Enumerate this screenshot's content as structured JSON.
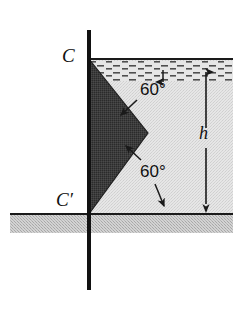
{
  "figure": {
    "type": "engineering-diagram",
    "canvas": {
      "width": 250,
      "height": 310,
      "background": "#ffffff"
    }
  },
  "labels": {
    "point_c": "C",
    "point_c_prime": "C′",
    "depth": "h",
    "angle_upper": "60°",
    "angle_lower": "60°"
  },
  "colors": {
    "wedge_fill": "#3a3a3a",
    "fluid_fill": "#e2e2e2",
    "ground_fill": "#c9c9c9",
    "line": "#1a1a1a",
    "surface_hatch": "#555555",
    "background": "#ffffff"
  },
  "geometry": {
    "wall": {
      "x": 89,
      "y_top": 30,
      "y_bottom": 290,
      "thickness": 4
    },
    "fluid_surface": {
      "y": 59,
      "x_start": 89,
      "x_end": 233
    },
    "fluid_region": {
      "x_start": 89,
      "x_end": 233,
      "y_top": 59,
      "y_bottom": 214
    },
    "ground_band": {
      "x_start": 10,
      "x_end": 233,
      "y_top": 214,
      "y_bottom": 233
    },
    "wedge": {
      "vertex_top": {
        "x": 89,
        "y": 59,
        "label": "C"
      },
      "vertex_apex": {
        "x": 148,
        "y": 133
      },
      "vertex_bottom": {
        "x": 89,
        "y": 214,
        "label": "C′"
      }
    },
    "dimension_h": {
      "x": 206,
      "y_top": 60,
      "y_bottom": 213,
      "arrows": "both"
    },
    "leader_surface": {
      "x": 163,
      "y_from": 80,
      "y_to": 60
    },
    "leader_angle_upper": {
      "x_from": 136,
      "y_from": 101,
      "x_to": 118,
      "y_to": 117
    },
    "leader_angle_lower_up": {
      "x_from": 140,
      "y_from": 162,
      "x_to": 123,
      "y_to": 145
    },
    "leader_angle_lower_down": {
      "x_from": 156,
      "y_from": 183,
      "x_to": 165,
      "y_to": 212
    }
  },
  "annotations": [
    {
      "name": "upper-face-angle",
      "value": "60°",
      "describes": "angle of upper inclined face of wedge"
    },
    {
      "name": "lower-face-angle",
      "value": "60°",
      "describes": "angle of lower inclined face of wedge"
    },
    {
      "name": "fluid-depth",
      "value": "h",
      "describes": "depth from free surface to floor"
    }
  ]
}
